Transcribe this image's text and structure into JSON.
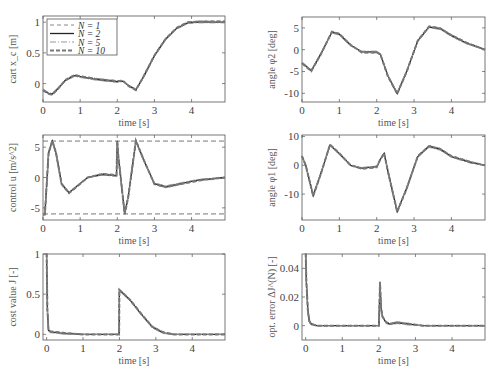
{
  "legend": {
    "entries": [
      "N = 1",
      "N = 2",
      "N = 5",
      "N = 10"
    ]
  },
  "chart_data": [
    {
      "type": "line",
      "id": "cart",
      "ylabel": "cart x_c [m]",
      "xlabel": "time [s]",
      "xlim": [
        0,
        4.9
      ],
      "ylim": [
        -0.3,
        1.1
      ],
      "xticks": [
        0,
        1,
        2,
        3,
        4
      ],
      "yticks": [
        0,
        0.5,
        1
      ],
      "ytick_labels": [
        "0",
        "0.5",
        "1"
      ],
      "box": [
        43,
        16,
        225,
        102
      ],
      "series": [
        {
          "name": "N = 2",
          "x": [
            0,
            0.15,
            0.25,
            0.4,
            0.6,
            0.85,
            1.1,
            1.4,
            1.7,
            2.0,
            2.15,
            2.3,
            2.5,
            2.7,
            3.0,
            3.3,
            3.6,
            3.9,
            4.2,
            4.5,
            4.9
          ],
          "y": [
            -0.1,
            -0.16,
            -0.17,
            -0.08,
            0.05,
            0.13,
            0.1,
            0.07,
            0.05,
            0.03,
            0.04,
            -0.03,
            -0.1,
            0.1,
            0.45,
            0.72,
            0.9,
            0.99,
            1.0,
            1.0,
            1.0
          ]
        }
      ]
    },
    {
      "type": "line",
      "id": "phi2",
      "ylabel": "angle φ2 [deg]",
      "xlabel": "time [s]",
      "xlim": [
        0,
        4.9
      ],
      "ylim": [
        -12,
        7.5
      ],
      "xticks": [
        0,
        1,
        2,
        3,
        4
      ],
      "yticks": [
        -10,
        -5,
        0,
        5
      ],
      "ytick_labels": [
        "-10",
        "-5",
        "0",
        "5"
      ],
      "box": [
        302,
        17,
        485,
        102
      ],
      "series": [
        {
          "name": "N = 2",
          "x": [
            0,
            0.25,
            0.5,
            0.8,
            1.0,
            1.3,
            1.6,
            2.0,
            2.1,
            2.3,
            2.55,
            2.8,
            3.1,
            3.4,
            3.7,
            4.0,
            4.4,
            4.9
          ],
          "y": [
            -3,
            -4.8,
            -1,
            4,
            3.5,
            1,
            -0.5,
            -0.5,
            -1,
            -6,
            -10,
            -5,
            2,
            5.2,
            4.8,
            3.2,
            1.5,
            0
          ]
        }
      ]
    },
    {
      "type": "line",
      "id": "control",
      "ylabel": "control u [m/s^2]",
      "xlabel": "time [s]",
      "xlim": [
        0,
        4.9
      ],
      "ylim": [
        -7,
        7
      ],
      "xticks": [
        0,
        1,
        2,
        3,
        4
      ],
      "yticks": [
        -5,
        0,
        5
      ],
      "ytick_labels": [
        "-5",
        "0",
        "5"
      ],
      "bounds": [
        -6,
        6
      ],
      "box": [
        43,
        135,
        225,
        220
      ],
      "series": [
        {
          "name": "N = 2",
          "x": [
            0,
            0.05,
            0.15,
            0.25,
            0.35,
            0.5,
            0.7,
            0.9,
            1.2,
            1.6,
            1.98,
            2.0,
            2.02,
            2.2,
            2.3,
            2.5,
            2.7,
            3.0,
            3.3,
            3.7,
            4.2,
            4.9
          ],
          "y": [
            -6,
            -6,
            4,
            6,
            4,
            -1,
            -2.5,
            -1.5,
            0,
            0.5,
            0.3,
            6,
            4,
            -6,
            -3,
            6,
            3,
            -1,
            -1.5,
            -1,
            -0.4,
            0
          ]
        }
      ]
    },
    {
      "type": "line",
      "id": "phi1",
      "ylabel": "angle φ1 [deg]",
      "xlabel": "time [s]",
      "xlim": [
        0,
        4.9
      ],
      "ylim": [
        -19,
        10.5
      ],
      "xticks": [
        0,
        1,
        2,
        3,
        4
      ],
      "yticks": [
        -10,
        0,
        10
      ],
      "ytick_labels": [
        "-10",
        "0",
        "10"
      ],
      "box": [
        302,
        135,
        485,
        220
      ],
      "series": [
        {
          "name": "N = 2",
          "x": [
            0,
            0.1,
            0.3,
            0.5,
            0.75,
            1.0,
            1.3,
            1.6,
            2.0,
            2.1,
            2.2,
            2.3,
            2.55,
            2.8,
            3.1,
            3.4,
            3.7,
            4.0,
            4.5,
            4.9
          ],
          "y": [
            3,
            0,
            -10.5,
            -3,
            7,
            4,
            0,
            -1,
            -0.5,
            2,
            4,
            -2,
            -16,
            -8,
            3,
            6.5,
            5.5,
            3,
            1,
            0
          ]
        }
      ]
    },
    {
      "type": "line",
      "id": "cost",
      "ylabel": "cost value J [-]",
      "xlabel": "time [s]",
      "xlim": [
        -0.1,
        4.9
      ],
      "ylim": [
        -0.07,
        1.0
      ],
      "xticks": [
        0,
        1,
        2,
        3,
        4
      ],
      "yticks": [
        0,
        0.5,
        1
      ],
      "ytick_labels": [
        "0",
        "0.5",
        "1"
      ],
      "box": [
        43,
        254,
        225,
        340
      ],
      "series": [
        {
          "name": "N = 2",
          "x": [
            0,
            0.02,
            0.05,
            0.1,
            0.5,
            1.0,
            1.99,
            2.0,
            2.3,
            2.6,
            2.9,
            3.2,
            3.5,
            4.0,
            4.9
          ],
          "y": [
            1.0,
            0.3,
            0.05,
            0.03,
            0.01,
            0,
            0,
            0.55,
            0.42,
            0.25,
            0.09,
            0.02,
            0,
            0,
            0
          ]
        }
      ]
    },
    {
      "type": "line",
      "id": "opt_error",
      "ylabel": "opt. error ΔJ^(N) [-]",
      "xlabel": "time [s]",
      "xlim": [
        -0.1,
        4.9
      ],
      "ylim": [
        -0.01,
        0.05
      ],
      "xticks": [
        0,
        1,
        2,
        3,
        4
      ],
      "yticks": [
        0,
        0.02,
        0.04
      ],
      "ytick_labels": [
        "0",
        "0.02",
        "0.04"
      ],
      "box": [
        302,
        254,
        485,
        340
      ],
      "series": [
        {
          "name": "N = 2",
          "x": [
            0,
            0.02,
            0.06,
            0.1,
            0.15,
            0.3,
            1.0,
            2.0,
            2.03,
            2.06,
            2.1,
            2.2,
            2.3,
            2.5,
            2.8,
            3.2,
            4.9
          ],
          "y": [
            0.05,
            0.03,
            0.01,
            0.003,
            0.001,
            0,
            0,
            0,
            0.03,
            0.012,
            0.006,
            0.002,
            0.001,
            0.002,
            0.001,
            0,
            0
          ]
        }
      ]
    }
  ]
}
